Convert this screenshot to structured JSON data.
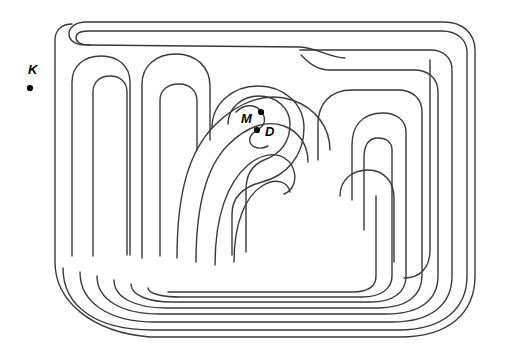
{
  "figure": {
    "kind": "labyrinth-diagram",
    "background_color": "#ffffff",
    "line_color": "#3a3a3a",
    "line_width": 1.4,
    "width": 509,
    "height": 354
  },
  "markers": [
    {
      "id": "K",
      "label": "K",
      "label_x": 28,
      "label_y": 74,
      "dot_x": 30,
      "dot_y": 88,
      "dot_radius": 3.1,
      "color": "#000000",
      "description": "point outside the labyrinth, upper left"
    },
    {
      "id": "M",
      "label": "M",
      "label_x": 241,
      "label_y": 123,
      "dot_x": 261,
      "dot_y": 112,
      "dot_radius": 3.1,
      "color": "#000000",
      "description": "point in upper lobe of the labyrinth centre"
    },
    {
      "id": "D",
      "label": "D",
      "label_x": 265,
      "label_y": 136,
      "dot_x": 257,
      "dot_y": 130,
      "dot_radius": 3.1,
      "color": "#000000",
      "description": "point in lower lobe of the labyrinth centre"
    }
  ],
  "maze_walls": [
    {
      "name": "outer-boundary",
      "d": "M 72 24 C 62 24 55 30 55 40 L 55 262 C 55 300 90 332 150 337 L 400 337 C 450 337 475 312 475 276 L 475 50 C 475 33 462 22 444 22 L 86 22 C 76 22 69 27 69 34 C 69 41 76 45 86 45 L 300 47 C 318 48 330 58 345 58"
    },
    {
      "name": "wall-ring-1",
      "d": "M 63 268 C 63 306 96 330 152 330 L 398 330 C 444 330 467 308 467 276 L 467 52 C 467 40 457 31 442 31 L 88 31 C 80 31 76 34 76 38 C 76 42 81 45 90 45"
    },
    {
      "name": "wall-outer-left-hook",
      "d": "M 72 256 L 72 82 C 72 66 84 56 101 56 C 118 56 130 66 130 82 L 130 255"
    },
    {
      "name": "wall-left-inner-hook",
      "d": "M 93 256 L 93 92 C 93 82 100 76 110 76 C 120 76 127 82 127 92 L 127 255"
    },
    {
      "name": "wall-ring-2",
      "d": "M 80 272 C 80 302 108 322 155 322 L 392 322 C 432 322 452 304 452 276 L 452 70 C 452 58 444 50 430 50 L 300 50"
    },
    {
      "name": "wall-second-left-hook",
      "d": "M 142 258 L 142 84 C 142 66 156 54 176 54 C 196 54 210 67 210 86 L 210 140"
    },
    {
      "name": "wall-second-inner-hook",
      "d": "M 160 256 L 160 100 C 160 90 168 84 179 84 C 190 84 197 91 197 101 L 197 150"
    },
    {
      "name": "wall-ring-3",
      "d": "M 97 276 C 97 300 122 314 160 314 L 386 314 C 420 314 438 300 438 276 L 438 92 C 438 78 428 70 414 70 L 330 70 C 316 70 308 62 301 55"
    },
    {
      "name": "wall-spiral-arm-a",
      "d": "M 177 258 C 177 190 190 150 215 125 C 240 100 268 92 292 100 C 316 108 330 128 330 150"
    },
    {
      "name": "wall-ring-4",
      "d": "M 114 280 C 114 298 136 308 166 308 L 378 308 C 406 308 422 296 422 276 L 422 112 C 422 98 412 90 398 90 L 352 90 C 330 90 318 104 318 124 L 318 160"
    },
    {
      "name": "wall-spiral-arm-b",
      "d": "M 196 262 C 196 200 208 165 228 145 C 248 125 268 120 284 126 C 300 132 308 146 308 162"
    },
    {
      "name": "wall-ring-5",
      "d": "M 131 284 C 131 296 150 302 172 302 L 370 302 C 394 302 406 292 406 276 L 406 132 C 406 120 396 113 383 113 C 362 113 352 126 352 145 L 352 200"
    },
    {
      "name": "wall-centre-spiral-outer",
      "d": "M 215 265 C 215 215 228 182 248 165 C 266 150 284 152 292 166 C 298 178 294 190 284 194"
    },
    {
      "name": "wall-ring-6",
      "d": "M 148 288 C 148 294 164 297 180 297 L 362 297 C 382 297 392 288 392 276 L 392 150 C 392 142 386 138 378 138 C 368 138 364 146 364 158 L 364 230"
    },
    {
      "name": "wall-centre-spiral-mid",
      "d": "M 234 262 C 234 222 246 196 262 186 C 276 177 288 182 290 192"
    },
    {
      "name": "wall-ring-7",
      "d": "M 168 292 L 352 292 C 368 292 376 286 376 276 L 376 196 C 376 240 376 260 376 276"
    },
    {
      "name": "wall-centre-ring-a",
      "d": "M 212 128 C 212 104 232 86 258 86 C 284 86 304 104 304 128 C 304 156 286 176 262 182 C 243 187 232 198 232 214 L 232 255"
    },
    {
      "name": "wall-centre-ring-b",
      "d": "M 228 124 C 228 108 242 96 259 96 C 276 96 290 108 290 124 C 290 142 280 154 264 160 C 252 165 246 175 246 190 L 246 252"
    },
    {
      "name": "wall-centre-s-divider",
      "d": "M 236 112 C 244 104 254 104 260 110 C 266 116 266 124 260 128 C 254 132 248 136 250 142 C 252 148 260 150 268 146"
    },
    {
      "name": "wall-right-notch",
      "d": "M 430 60 L 430 250 C 430 268 420 278 404 278"
    },
    {
      "name": "wall-right-u-turn",
      "d": "M 340 196 C 340 180 352 170 368 170 C 384 170 394 182 394 198 L 394 262"
    }
  ]
}
